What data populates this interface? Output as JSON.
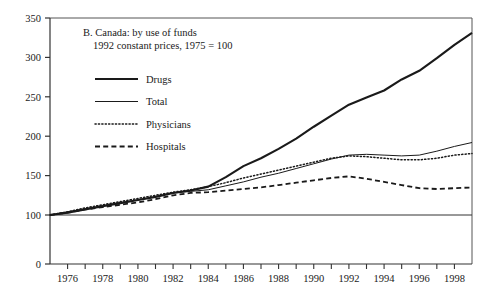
{
  "chart_data": {
    "type": "line",
    "title": "B. Canada: by use of funds",
    "subtitle": "1992 constant prices, 1975 = 100",
    "xlabel": "",
    "ylabel": "",
    "grid": false,
    "legend_position": "top-left-inside",
    "xlim": [
      1975,
      1999
    ],
    "ylim": [
      0,
      350
    ],
    "y_axis_break": true,
    "y_break_note": "axis is broken between 0 and 100",
    "yticks": [
      0,
      100,
      150,
      200,
      250,
      300,
      350
    ],
    "ytick_labels": [
      "0",
      "100",
      "150",
      "200",
      "250",
      "300",
      "350"
    ],
    "xticks": [
      1975,
      1976,
      1977,
      1978,
      1979,
      1980,
      1981,
      1982,
      1983,
      1984,
      1985,
      1986,
      1987,
      1988,
      1989,
      1990,
      1991,
      1992,
      1993,
      1994,
      1995,
      1996,
      1997,
      1998,
      1999
    ],
    "xtick_labels": [
      "1976",
      "1978",
      "1980",
      "1982",
      "1984",
      "1986",
      "1988",
      "1990",
      "1992",
      "1994",
      "1996",
      "1998"
    ],
    "xtick_labelled_years": [
      1976,
      1978,
      1980,
      1982,
      1984,
      1986,
      1988,
      1990,
      1992,
      1994,
      1996,
      1998
    ],
    "reference_line": 100,
    "x": [
      1975,
      1976,
      1977,
      1978,
      1979,
      1980,
      1981,
      1982,
      1983,
      1984,
      1985,
      1986,
      1987,
      1988,
      1989,
      1990,
      1991,
      1992,
      1993,
      1994,
      1995,
      1996,
      1997,
      1998,
      1999
    ],
    "series": [
      {
        "name": "Drugs",
        "style": "solid-thick",
        "color": "#1a1a1a",
        "values": [
          100,
          103,
          107,
          111,
          115,
          119,
          123,
          128,
          131,
          136,
          148,
          162,
          172,
          184,
          197,
          212,
          226,
          240,
          249,
          258,
          272,
          283,
          299,
          316,
          331
        ]
      },
      {
        "name": "Total",
        "style": "solid-thin",
        "color": "#1a1a1a",
        "values": [
          100,
          104,
          108,
          112,
          116,
          119,
          123,
          128,
          130,
          132,
          137,
          142,
          148,
          153,
          159,
          165,
          171,
          176,
          177,
          176,
          175,
          176,
          181,
          187,
          192
        ]
      },
      {
        "name": "Physicians",
        "style": "dotted",
        "color": "#1a1a1a",
        "values": [
          100,
          104,
          109,
          113,
          117,
          121,
          125,
          129,
          132,
          136,
          141,
          147,
          152,
          157,
          162,
          167,
          172,
          175,
          174,
          172,
          170,
          170,
          172,
          176,
          178
        ]
      },
      {
        "name": "Hospitals",
        "style": "dashed",
        "color": "#1a1a1a",
        "values": [
          100,
          103,
          107,
          110,
          113,
          116,
          120,
          125,
          128,
          129,
          131,
          133,
          135,
          138,
          141,
          144,
          147,
          149,
          146,
          142,
          138,
          134,
          133,
          134,
          135
        ]
      }
    ]
  },
  "legend": {
    "items": [
      {
        "label": "Drugs",
        "style": "solid-thick"
      },
      {
        "label": "Total",
        "style": "solid-thin"
      },
      {
        "label": "Physicians",
        "style": "dotted"
      },
      {
        "label": "Hospitals",
        "style": "dashed"
      }
    ]
  }
}
